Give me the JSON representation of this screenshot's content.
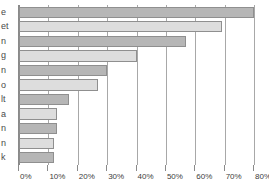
{
  "chart_data": {
    "type": "bar",
    "orientation": "horizontal",
    "title": "",
    "subtitle": "",
    "xlabel": "",
    "ylabel": "",
    "xlim": [
      0,
      80
    ],
    "grid": true,
    "legend": null,
    "tick_labels": [
      "0%",
      "10%",
      "20%",
      "30%",
      "40%",
      "50%",
      "60%",
      "70%",
      "80%"
    ],
    "tick_values": [
      0,
      10,
      20,
      30,
      40,
      50,
      60,
      70,
      80
    ],
    "categories": [
      "e",
      "et",
      "n",
      "g",
      "n",
      "o",
      "lt",
      "a",
      "n",
      "n",
      "k"
    ],
    "values": [
      80,
      69,
      57,
      40,
      30,
      27,
      17,
      13,
      13,
      12,
      12
    ],
    "bar_colors": [
      "#b6b6b6",
      "#dddddd",
      "#b6b6b6",
      "#dddddd",
      "#b6b6b6",
      "#dddddd",
      "#b6b6b6",
      "#dddddd",
      "#b6b6b6",
      "#dddddd",
      "#b6b6b6"
    ]
  },
  "colors": {
    "bar_dark": "#b6b6b6",
    "bar_light": "#dddddd",
    "bar_border": "#8f8f8f",
    "axis": "#8a8a8a",
    "gridline": "#a8a8a8",
    "label_text": "#4a4a4a",
    "tick_text": "#3d3d3d",
    "background": "#ffffff"
  }
}
